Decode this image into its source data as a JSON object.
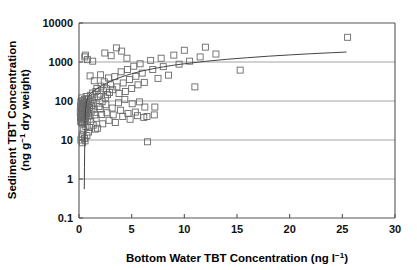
{
  "chart_data": {
    "type": "scatter",
    "title": "",
    "xlabel": "Bottom Water TBT Concentration (ng l−1)",
    "xlabel_main": "Bottom Water TBT Concentration (ng l",
    "xlabel_sup": "−1",
    "xlabel_tail": ")",
    "ylabel_line1": "Sediment TBT Concentration",
    "ylabel_line2_a": "(ng g",
    "ylabel_line2_sup": "−1",
    "ylabel_line2_b": " dry weight)",
    "ylabel": "Sediment TBT Concentration (ng g−1 dry weight)",
    "xscale": "linear",
    "yscale": "log",
    "xlim": [
      0,
      30
    ],
    "ylim": [
      0.1,
      10000
    ],
    "xticks": [
      0,
      5,
      10,
      15,
      20,
      25,
      30
    ],
    "xtick_labels": [
      "0",
      "5",
      "10",
      "15",
      "20",
      "25",
      "30"
    ],
    "yticks": [
      0.1,
      1,
      10,
      100,
      1000,
      10000
    ],
    "ytick_labels": [
      "0.1",
      "1",
      "10",
      "100",
      "1000",
      "10000"
    ],
    "grid": true,
    "grid_axis": "y",
    "grid_color": "#9a9a9a",
    "axis_color": "#555555",
    "marker": "open-square",
    "marker_edge_color": "#6a6a6a",
    "marker_face_color": "none",
    "marker_size_px": 6,
    "legend": null,
    "series": [
      {
        "name": "Sediment vs bottom water TBT",
        "points": [
          [
            0.12,
            52
          ],
          [
            0.14,
            38
          ],
          [
            0.15,
            74
          ],
          [
            0.16,
            30
          ],
          [
            0.18,
            96
          ],
          [
            0.2,
            45
          ],
          [
            0.21,
            62
          ],
          [
            0.22,
            28
          ],
          [
            0.24,
            120
          ],
          [
            0.25,
            40
          ],
          [
            0.27,
            58
          ],
          [
            0.28,
            85
          ],
          [
            0.3,
            33
          ],
          [
            0.31,
            70
          ],
          [
            0.33,
            48
          ],
          [
            0.35,
            102
          ],
          [
            0.36,
            26
          ],
          [
            0.38,
            66
          ],
          [
            0.4,
            44
          ],
          [
            0.42,
            90
          ],
          [
            0.44,
            35
          ],
          [
            0.46,
            56
          ],
          [
            0.48,
            78
          ],
          [
            0.5,
            29
          ],
          [
            0.52,
            110
          ],
          [
            0.55,
            42
          ],
          [
            0.58,
            64
          ],
          [
            0.6,
            88
          ],
          [
            0.62,
            36
          ],
          [
            0.65,
            54
          ],
          [
            0.68,
            130
          ],
          [
            0.7,
            46
          ],
          [
            0.72,
            72
          ],
          [
            0.75,
            98
          ],
          [
            0.78,
            34
          ],
          [
            0.8,
            60
          ],
          [
            0.85,
            82
          ],
          [
            0.88,
            50
          ],
          [
            0.9,
            115
          ],
          [
            0.95,
            41
          ],
          [
            1.0,
            68
          ],
          [
            1.05,
            95
          ],
          [
            1.1,
            140
          ],
          [
            1.15,
            55
          ],
          [
            1.2,
            76
          ],
          [
            1.25,
            105
          ],
          [
            1.3,
            160
          ],
          [
            1.35,
            62
          ],
          [
            1.4,
            88
          ],
          [
            1.45,
            125
          ],
          [
            1.5,
            44
          ],
          [
            1.6,
            175
          ],
          [
            1.7,
            210
          ],
          [
            1.8,
            130
          ],
          [
            1.9,
            72
          ],
          [
            2.0,
            150
          ],
          [
            2.1,
            240
          ],
          [
            2.2,
            96
          ],
          [
            2.3,
            185
          ],
          [
            2.4,
            310
          ],
          [
            2.5,
            120
          ],
          [
            2.6,
            205
          ],
          [
            2.7,
            145
          ],
          [
            2.8,
            390
          ],
          [
            2.9,
            165
          ],
          [
            3.0,
            260
          ],
          [
            3.2,
            195
          ],
          [
            3.4,
            420
          ],
          [
            3.6,
            230
          ],
          [
            3.8,
            155
          ],
          [
            4.0,
            560
          ],
          [
            4.2,
            290
          ],
          [
            4.4,
            175
          ],
          [
            4.6,
            640
          ],
          [
            4.8,
            355
          ],
          [
            5.0,
            210
          ],
          [
            5.2,
            780
          ],
          [
            5.4,
            430
          ],
          [
            5.6,
            260
          ],
          [
            5.8,
            900
          ],
          [
            6.0,
            520
          ],
          [
            6.2,
            300
          ],
          [
            6.5,
            9
          ],
          [
            6.8,
            1100
          ],
          [
            7.0,
            640
          ],
          [
            7.2,
            70
          ],
          [
            7.5,
            380
          ],
          [
            7.8,
            1250
          ],
          [
            8.0,
            760
          ],
          [
            8.5,
            460
          ],
          [
            9.0,
            1500
          ],
          [
            9.5,
            880
          ],
          [
            10.0,
            2000
          ],
          [
            10.5,
            1050
          ],
          [
            11.0,
            230
          ],
          [
            11.5,
            1350
          ],
          [
            12.0,
            2400
          ],
          [
            13.0,
            1600
          ],
          [
            15.3,
            620
          ],
          [
            25.5,
            4300
          ],
          [
            0.55,
            1350
          ],
          [
            0.62,
            1500
          ],
          [
            0.8,
            1150
          ],
          [
            1.3,
            1050
          ],
          [
            1.05,
            440
          ],
          [
            1.45,
            330
          ],
          [
            2.05,
            470
          ],
          [
            2.45,
            1700
          ],
          [
            3.05,
            1450
          ],
          [
            3.55,
            2300
          ],
          [
            4.05,
            1900
          ],
          [
            4.55,
            1250
          ],
          [
            0.35,
            14
          ],
          [
            0.45,
            18
          ],
          [
            0.65,
            22
          ],
          [
            0.9,
            16
          ],
          [
            1.35,
            24
          ],
          [
            1.75,
            20
          ],
          [
            2.25,
            26
          ],
          [
            2.85,
            32
          ],
          [
            3.45,
            28
          ],
          [
            4.15,
            40
          ],
          [
            4.85,
            34
          ],
          [
            5.55,
            42
          ],
          [
            6.15,
            38
          ],
          [
            0.28,
            12
          ],
          [
            0.52,
            11
          ],
          [
            0.75,
            13
          ],
          [
            1.02,
            21
          ],
          [
            1.55,
            19
          ],
          [
            2.15,
            45
          ],
          [
            2.65,
            50
          ],
          [
            3.25,
            44
          ],
          [
            3.95,
            58
          ],
          [
            4.65,
            48
          ],
          [
            5.35,
            52
          ],
          [
            6.45,
            40
          ],
          [
            7.15,
            44
          ],
          [
            0.18,
            10
          ],
          [
            0.33,
            8.5
          ],
          [
            0.58,
            9.5
          ],
          [
            1.12,
            30
          ],
          [
            1.62,
            36
          ],
          [
            2.02,
            62
          ],
          [
            2.55,
            80
          ],
          [
            3.15,
            66
          ],
          [
            3.75,
            90
          ],
          [
            4.35,
            110
          ],
          [
            5.05,
            85
          ],
          [
            5.75,
            95
          ],
          [
            6.25,
            70
          ]
        ]
      }
    ],
    "fit_curve": {
      "name": "fitted logarithmic regression",
      "color": "#444444",
      "points": [
        [
          0.5,
          0.55
        ],
        [
          0.52,
          2.0
        ],
        [
          0.55,
          10
        ],
        [
          0.58,
          30
        ],
        [
          0.62,
          60
        ],
        [
          0.7,
          95
        ],
        [
          0.85,
          125
        ],
        [
          1.0,
          145
        ],
        [
          1.2,
          165
        ],
        [
          1.5,
          190
        ],
        [
          1.8,
          215
        ],
        [
          2.2,
          250
        ],
        [
          2.6,
          285
        ],
        [
          3.0,
          320
        ],
        [
          3.5,
          365
        ],
        [
          4.0,
          410
        ],
        [
          4.5,
          455
        ],
        [
          5.0,
          500
        ],
        [
          6.0,
          590
        ],
        [
          7.0,
          670
        ],
        [
          8.0,
          750
        ],
        [
          9.0,
          830
        ],
        [
          10.0,
          900
        ],
        [
          12.0,
          1040
        ],
        [
          14.0,
          1170
        ],
        [
          16.0,
          1290
        ],
        [
          18.0,
          1410
        ],
        [
          20.0,
          1520
        ],
        [
          22.0,
          1630
        ],
        [
          24.0,
          1730
        ],
        [
          25.4,
          1800
        ]
      ]
    }
  }
}
